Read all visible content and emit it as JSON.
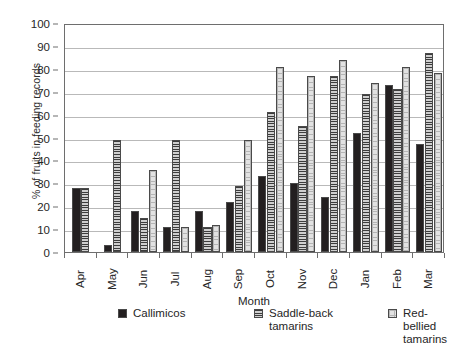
{
  "chart_data": {
    "type": "bar",
    "title": "",
    "xlabel": "Month",
    "ylabel": "% of fruits in feeding records",
    "categories": [
      "Apr",
      "May",
      "Jun",
      "Jul",
      "Aug",
      "Sep",
      "Oct",
      "Nov",
      "Dec",
      "Jan",
      "Feb",
      "Mar"
    ],
    "ylim": [
      0,
      100
    ],
    "yticks": [
      0,
      10,
      20,
      30,
      40,
      50,
      60,
      70,
      80,
      90,
      100
    ],
    "grid": true,
    "legend_position": "bottom",
    "series": [
      {
        "name": "Callimicos",
        "color": "#231f20",
        "pattern": "solid",
        "values": [
          28,
          3,
          18,
          11,
          18,
          22,
          33,
          30,
          24,
          52,
          73,
          47
        ]
      },
      {
        "name": "Saddle-back tamarins",
        "color": "#9a9a9a",
        "pattern": "horizontal-lines",
        "values": [
          28,
          49,
          15,
          49,
          11,
          29,
          61,
          55,
          77,
          69,
          71,
          87
        ]
      },
      {
        "name": "Red-bellied tamarins",
        "color": "#e2e2e2",
        "pattern": "grid-checker",
        "values": [
          null,
          null,
          36,
          11,
          12,
          49,
          81,
          77,
          84,
          74,
          81,
          78
        ]
      }
    ]
  },
  "legend": {
    "items": [
      {
        "label": "Callimicos"
      },
      {
        "label": "Saddle-back\ntamarins"
      },
      {
        "label": "Red-bellied\ntamarins"
      }
    ]
  }
}
